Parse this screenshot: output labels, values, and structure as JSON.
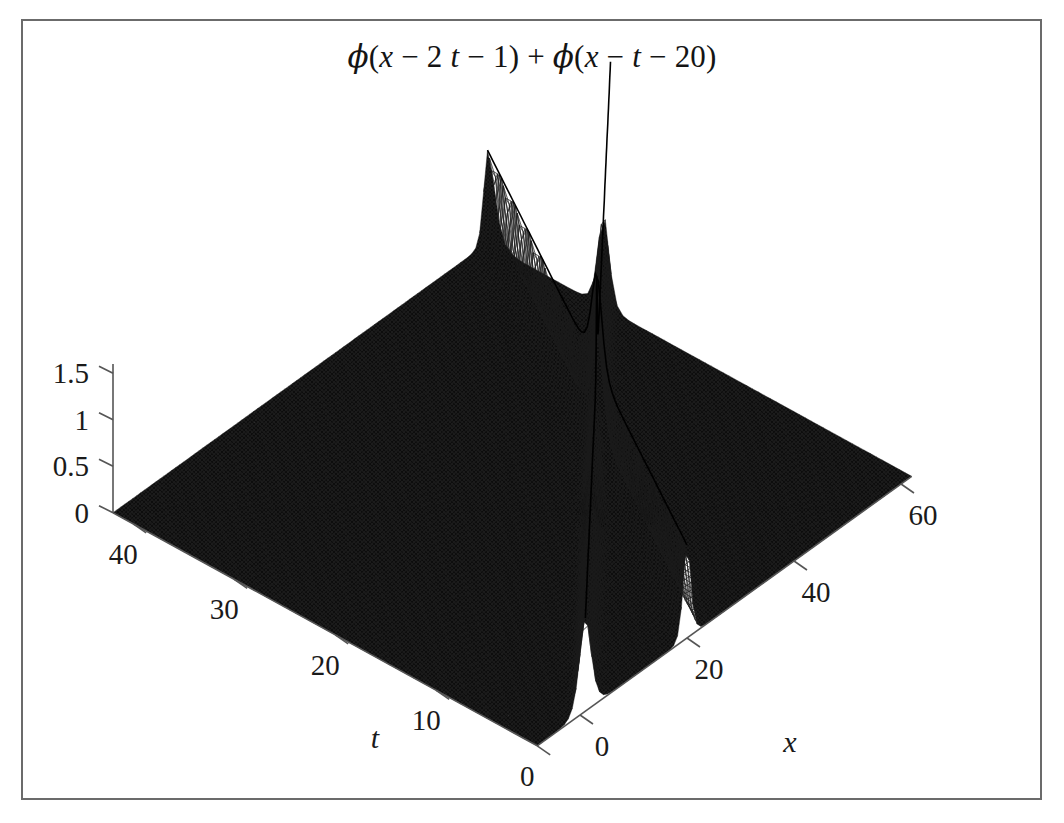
{
  "figure": {
    "title_plain": "ϕ(x − 2 t − 1) + ϕ(x − t − 20)",
    "background_color": "#ffffff",
    "border_color": "#6b6b6b",
    "surface_color": "#0d0d0d",
    "mesh_color": "#2a2a2a",
    "axis_color": "#555555",
    "text_color": "#1a1a1a"
  },
  "axes": {
    "x": {
      "name": "x",
      "ticks": [
        "0",
        "20",
        "40",
        "60"
      ],
      "tick_values": [
        0,
        20,
        40,
        60
      ],
      "range": [
        -8,
        62
      ]
    },
    "t": {
      "name": "t",
      "ticks": [
        "0",
        "10",
        "20",
        "30",
        "40"
      ],
      "tick_values": [
        0,
        10,
        20,
        30,
        40
      ],
      "range": [
        0,
        42
      ]
    },
    "z": {
      "name": "",
      "ticks": [
        "0",
        "0.5",
        "1",
        "1.5"
      ],
      "tick_values": [
        0,
        0.5,
        1,
        1.5
      ],
      "range": [
        0,
        1.6
      ]
    }
  },
  "chart_data": {
    "type": "surface",
    "title": "ϕ(x − 2 t − 1) + ϕ(x − t − 20)",
    "xlabel": "x",
    "ylabel": "t",
    "zlabel": "",
    "xlim": [
      -8,
      62
    ],
    "ylim": [
      0,
      42
    ],
    "zlim": [
      0,
      1.6
    ],
    "xticks": [
      0,
      20,
      40,
      60
    ],
    "yticks": [
      0,
      10,
      20,
      30,
      40
    ],
    "zticks": [
      0,
      0.5,
      1,
      1.5
    ],
    "grid": false,
    "legend": "none",
    "formula": "z(x,t) = phi(x - 2t - 1) + phi(x - t - 20)",
    "solitons": [
      {
        "name": "fast",
        "speed": 2,
        "offset": 1,
        "amplitude": 1.0,
        "width": 1.45
      },
      {
        "name": "slow",
        "speed": 1,
        "offset": 20,
        "amplitude": 1.0,
        "width": 0.95
      }
    ],
    "peak_height": 1.5,
    "samples": {
      "nx": 96,
      "nt": 72
    }
  },
  "projection": {
    "origin_screen": [
      580,
      715
    ],
    "x_axis_screen_step": [
      5.35,
      -3.85
    ],
    "t_axis_screen_step": [
      -10.1,
      -5.55
    ],
    "z_axis_screen_step": [
      0,
      -93.0
    ]
  }
}
